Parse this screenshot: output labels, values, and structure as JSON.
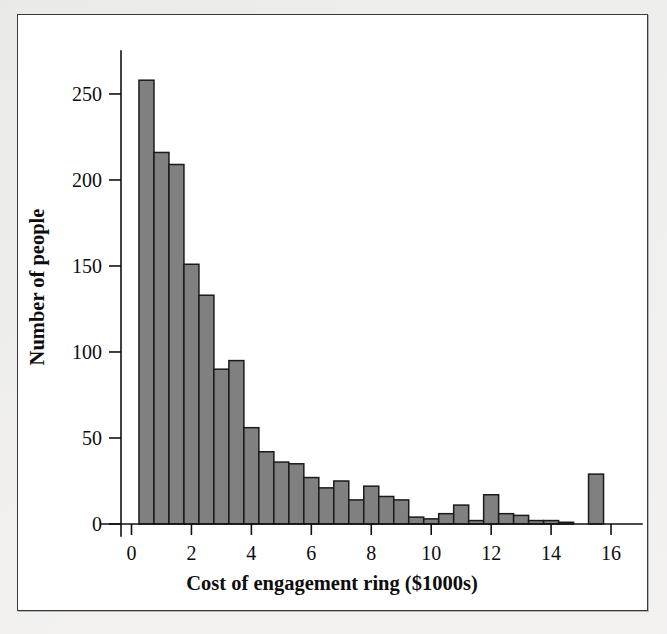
{
  "figure": {
    "background_color": "#ffffff",
    "frame_color": "#3a3a3a",
    "page_background": "#f2f2f1"
  },
  "chart_data": {
    "type": "bar",
    "subtype": "histogram",
    "title": "",
    "xlabel": "Cost of engagement ring ($1000s)",
    "ylabel": "Number of people",
    "xlim": [
      -0.35,
      16.9
    ],
    "ylim": [
      0,
      268
    ],
    "xticks": [
      0,
      2,
      4,
      6,
      8,
      10,
      12,
      14,
      16
    ],
    "xtick_labels": [
      "0",
      "2",
      "4",
      "6",
      "8",
      "10",
      "12",
      "14",
      "16"
    ],
    "yticks": [
      0,
      50,
      100,
      150,
      200,
      250
    ],
    "ytick_labels": [
      "0",
      "50",
      "100",
      "150",
      "200",
      "250"
    ],
    "grid": false,
    "legend": null,
    "bar_color": "#808080",
    "bar_edge_color": "#1a1a1a",
    "bin_width": 0.5,
    "bin_starts": [
      0.25,
      0.75,
      1.25,
      1.75,
      2.25,
      2.75,
      3.25,
      3.75,
      4.25,
      4.75,
      5.25,
      5.75,
      6.25,
      6.75,
      7.25,
      7.75,
      8.25,
      8.75,
      9.25,
      9.75,
      10.25,
      10.75,
      11.25,
      11.75,
      12.25,
      12.75,
      13.25,
      13.75,
      14.25,
      14.75,
      15.25
    ],
    "bin_centers": [
      0.5,
      1.0,
      1.5,
      2.0,
      2.5,
      3.0,
      3.5,
      4.0,
      4.5,
      5.0,
      5.5,
      6.0,
      6.5,
      7.0,
      7.5,
      8.0,
      8.5,
      9.0,
      9.5,
      10.0,
      10.5,
      11.0,
      11.5,
      12.0,
      12.5,
      13.0,
      13.5,
      14.0,
      14.5,
      15.0,
      15.5
    ],
    "values": [
      258,
      216,
      209,
      151,
      133,
      90,
      95,
      56,
      42,
      36,
      35,
      27,
      21,
      25,
      14,
      22,
      16,
      14,
      4,
      3,
      6,
      11,
      2,
      17,
      6,
      5,
      2,
      2,
      1,
      0,
      29
    ],
    "categories": [
      "0.25-0.75",
      "0.75-1.25",
      "1.25-1.75",
      "1.75-2.25",
      "2.25-2.75",
      "2.75-3.25",
      "3.25-3.75",
      "3.75-4.25",
      "4.25-4.75",
      "4.75-5.25",
      "5.25-5.75",
      "5.75-6.25",
      "6.25-6.75",
      "6.75-7.25",
      "7.25-7.75",
      "7.75-8.25",
      "8.25-8.75",
      "8.75-9.25",
      "9.25-9.75",
      "9.75-10.25",
      "10.25-10.75",
      "10.75-11.25",
      "11.25-11.75",
      "11.75-12.25",
      "12.25-12.75",
      "12.75-13.25",
      "13.25-13.75",
      "13.75-14.25",
      "14.25-14.75",
      "14.75-15.25",
      "15.25-15.75"
    ]
  }
}
